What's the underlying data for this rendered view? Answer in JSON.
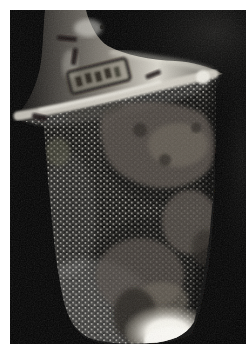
{
  "figure": {
    "kind": "photograph",
    "stamp_legible": false
  },
  "colors": {
    "page_bg": "#ffffff",
    "photo_bg": "#030303",
    "background_glow": "#55534e",
    "silhouette_base": "#0c0b0a",
    "bead_gap": "#070706",
    "bead_body": "#21201d",
    "bead_highlight": "#c9c7c0",
    "neck_edge_dark": "#0f0e0d",
    "neck_shadow": "#3a3733",
    "neck_mid": "#8a857c",
    "neck_bright": "#d8d5cb",
    "neck_low": "#55524b",
    "collar": "#d4d0c6",
    "collar_highlight": "#efede5",
    "tissue_main": "#564f48",
    "tissue_light": "#6e675c",
    "tissue_dark": "#2a2622",
    "tissue_olive": "#5a5a46",
    "tip_core": "#fbfaf5",
    "tip_glow": "#f5f3ec",
    "tip_fade": "#8a857a",
    "label_ink": "#1c1914",
    "label_fill": "#97927f",
    "mark_ink": "#13110e"
  }
}
